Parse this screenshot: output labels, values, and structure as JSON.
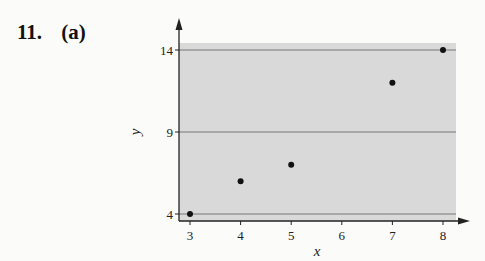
{
  "problem": {
    "number": "11.",
    "part": "(a)"
  },
  "chart_data": {
    "type": "scatter",
    "title": "",
    "xlabel": "x",
    "ylabel": "y",
    "x": [
      3,
      4,
      5,
      7,
      8
    ],
    "y": [
      4,
      6,
      7,
      12,
      14
    ],
    "xticks": [
      3,
      4,
      5,
      6,
      7,
      8
    ],
    "yticks": [
      4,
      9,
      14
    ],
    "xlim": [
      2.8,
      8.3
    ],
    "ylim": [
      3.6,
      14.4
    ],
    "grid": "horizontal lines at y ticks",
    "background_shading": "#d9d9d9",
    "marker_color": "#111111",
    "legend": null
  }
}
